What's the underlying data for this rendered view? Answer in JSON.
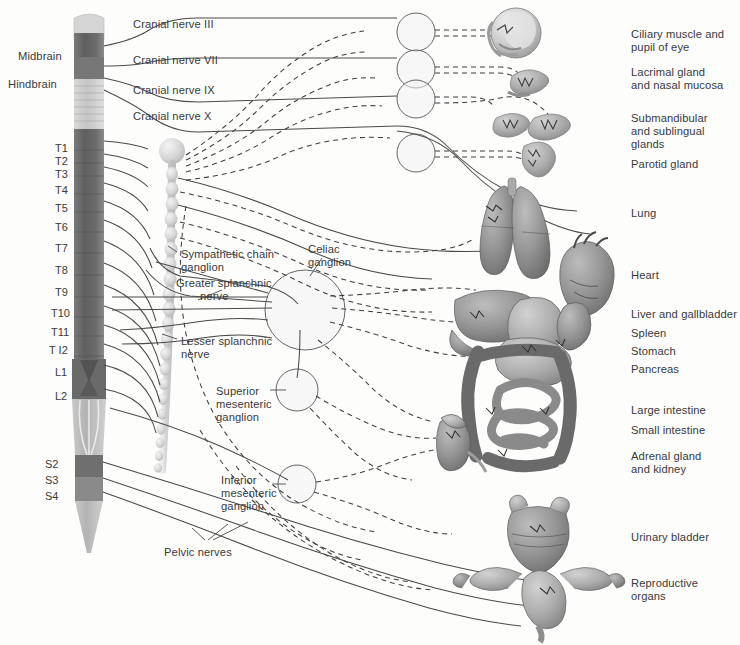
{
  "figure": {
    "background": "#fdfdfc",
    "ink": "#3a3a3a",
    "line_solid_color": "#4a4a4a",
    "line_dashed_color": "#3f3f3f"
  },
  "brain_labels": [
    {
      "name": "midbrain",
      "text": "Midbrain",
      "x": 18,
      "y": 50
    },
    {
      "name": "hindbrain",
      "text": "Hindbrain",
      "x": 8,
      "y": 78
    }
  ],
  "cranial_nerves": [
    {
      "name": "cranial-nerve-3",
      "text": "Cranial nerve III",
      "x": 133,
      "y": 18
    },
    {
      "name": "cranial-nerve-7",
      "text": "Cranial nerve VII",
      "x": 133,
      "y": 54
    },
    {
      "name": "cranial-nerve-9",
      "text": "Cranial nerve IX",
      "x": 133,
      "y": 84
    },
    {
      "name": "cranial-nerve-10",
      "text": "Cranial nerve X",
      "x": 133,
      "y": 110
    }
  ],
  "spinal_segments": [
    {
      "name": "segment-t1",
      "text": "T1",
      "x": 55,
      "y": 143
    },
    {
      "name": "segment-t2",
      "text": "T2",
      "x": 55,
      "y": 156
    },
    {
      "name": "segment-t3",
      "text": "T3",
      "x": 55,
      "y": 169
    },
    {
      "name": "segment-t4",
      "text": "T4",
      "x": 55,
      "y": 185
    },
    {
      "name": "segment-t5",
      "text": "T5",
      "x": 55,
      "y": 203
    },
    {
      "name": "segment-t6",
      "text": "T6",
      "x": 55,
      "y": 222
    },
    {
      "name": "segment-t7",
      "text": "T7",
      "x": 55,
      "y": 243
    },
    {
      "name": "segment-t8",
      "text": "T8",
      "x": 55,
      "y": 265
    },
    {
      "name": "segment-t9",
      "text": "T9",
      "x": 55,
      "y": 287
    },
    {
      "name": "segment-t10",
      "text": "T10",
      "x": 51,
      "y": 308
    },
    {
      "name": "segment-t11",
      "text": "T11",
      "x": 51,
      "y": 327
    },
    {
      "name": "segment-t12",
      "text": "T I2",
      "x": 49,
      "y": 345
    },
    {
      "name": "segment-l1",
      "text": "L1",
      "x": 55,
      "y": 367
    },
    {
      "name": "segment-l2",
      "text": "L2",
      "x": 55,
      "y": 391
    },
    {
      "name": "segment-s2",
      "text": "S2",
      "x": 45,
      "y": 459
    },
    {
      "name": "segment-s3",
      "text": "S3",
      "x": 45,
      "y": 475
    },
    {
      "name": "segment-s4",
      "text": "S4",
      "x": 45,
      "y": 491
    }
  ],
  "internal_labels": [
    {
      "name": "sympathetic-chain-ganglion",
      "lines": [
        "Sympathetic chain",
        "ganglion"
      ],
      "x": 181,
      "y": 248
    },
    {
      "name": "greater-splanchnic-nerve",
      "lines": [
        "Greater splanchnic",
        "nerve"
      ],
      "x": 176,
      "y": 277,
      "indent": 24
    },
    {
      "name": "celiac-ganglion",
      "lines": [
        "Celiac",
        "ganglion"
      ],
      "x": 308,
      "y": 243
    },
    {
      "name": "lesser-splanchnic-nerve",
      "lines": [
        "Lesser splanchnic",
        "nerve"
      ],
      "x": 181,
      "y": 335
    },
    {
      "name": "superior-mesenteric-ganglion",
      "lines": [
        "Superior",
        "mesenteric",
        "ganglion"
      ],
      "x": 216,
      "y": 385
    },
    {
      "name": "inferior-mesenteric-ganglion",
      "lines": [
        "Inferior",
        "mesenteric",
        "ganglion"
      ],
      "x": 221,
      "y": 474
    },
    {
      "name": "pelvic-nerves",
      "lines": [
        "Pelvic nerves"
      ],
      "x": 164,
      "y": 546
    }
  ],
  "organ_labels": [
    {
      "name": "organ-ciliary-muscle-pupil",
      "lines": [
        "Ciliary muscle and",
        "pupil of eye"
      ],
      "x": 631,
      "y": 28
    },
    {
      "name": "organ-lacrimal-nasal",
      "lines": [
        "Lacrimal gland",
        "and nasal mucosa"
      ],
      "x": 631,
      "y": 66
    },
    {
      "name": "organ-submandibular-sublingual",
      "lines": [
        "Submandibular",
        "and sublingual",
        "glands"
      ],
      "x": 631,
      "y": 112
    },
    {
      "name": "organ-parotid-gland",
      "lines": [
        "Parotid gland"
      ],
      "x": 631,
      "y": 158
    },
    {
      "name": "organ-lung",
      "lines": [
        "Lung"
      ],
      "x": 631,
      "y": 207
    },
    {
      "name": "organ-heart",
      "lines": [
        "Heart"
      ],
      "x": 631,
      "y": 269
    },
    {
      "name": "organ-liver-gallbladder",
      "lines": [
        "Liver and gallbladder"
      ],
      "x": 631,
      "y": 308
    },
    {
      "name": "organ-spleen",
      "lines": [
        "Spleen"
      ],
      "x": 631,
      "y": 327
    },
    {
      "name": "organ-stomach",
      "lines": [
        "Stomach"
      ],
      "x": 631,
      "y": 345
    },
    {
      "name": "organ-pancreas",
      "lines": [
        "Pancreas"
      ],
      "x": 631,
      "y": 363
    },
    {
      "name": "organ-large-intestine",
      "lines": [
        "Large intestine"
      ],
      "x": 631,
      "y": 404
    },
    {
      "name": "organ-small-intestine",
      "lines": [
        "Small intestine"
      ],
      "x": 631,
      "y": 424
    },
    {
      "name": "organ-adrenal-kidney",
      "lines": [
        "Adrenal gland",
        "and kidney"
      ],
      "x": 631,
      "y": 450
    },
    {
      "name": "organ-urinary-bladder",
      "lines": [
        "Urinary bladder"
      ],
      "x": 631,
      "y": 531
    },
    {
      "name": "organ-reproductive-organs",
      "lines": [
        "Reproductive",
        "organs"
      ],
      "x": 631,
      "y": 577
    }
  ],
  "ganglion_circles": [
    {
      "name": "ganglion-circle-ciliary",
      "cx": 416,
      "cy": 32,
      "r": 19
    },
    {
      "name": "ganglion-circle-pterygopalatine",
      "cx": 416,
      "cy": 69,
      "r": 19
    },
    {
      "name": "ganglion-circle-submandibular",
      "cx": 416,
      "cy": 99,
      "r": 19
    },
    {
      "name": "ganglion-circle-otic",
      "cx": 416,
      "cy": 153,
      "r": 19
    },
    {
      "name": "ganglion-circle-celiac",
      "cx": 305,
      "cy": 310,
      "r": 40
    },
    {
      "name": "ganglion-circle-superior-mesenteric",
      "cx": 297,
      "cy": 390,
      "r": 21
    },
    {
      "name": "ganglion-circle-inferior-mesenteric",
      "cx": 297,
      "cy": 484,
      "r": 19
    }
  ],
  "organs": [
    {
      "name": "organ-eye",
      "cx": 516,
      "cy": 33
    },
    {
      "name": "organ-lacrimal-gland",
      "cx": 530,
      "cy": 79
    },
    {
      "name": "organ-salivary-glands",
      "cx": 520,
      "cy": 125
    },
    {
      "name": "organ-parotid",
      "cx": 536,
      "cy": 155
    },
    {
      "name": "organ-lungs",
      "cx": 510,
      "cy": 220
    },
    {
      "name": "organ-heart-art",
      "cx": 585,
      "cy": 265
    },
    {
      "name": "organ-abdominal-viscera",
      "cx": 530,
      "cy": 380
    },
    {
      "name": "organ-kidney",
      "cx": 452,
      "cy": 440
    },
    {
      "name": "organ-bladder",
      "cx": 540,
      "cy": 530
    },
    {
      "name": "organ-uterus",
      "cx": 545,
      "cy": 595
    }
  ]
}
